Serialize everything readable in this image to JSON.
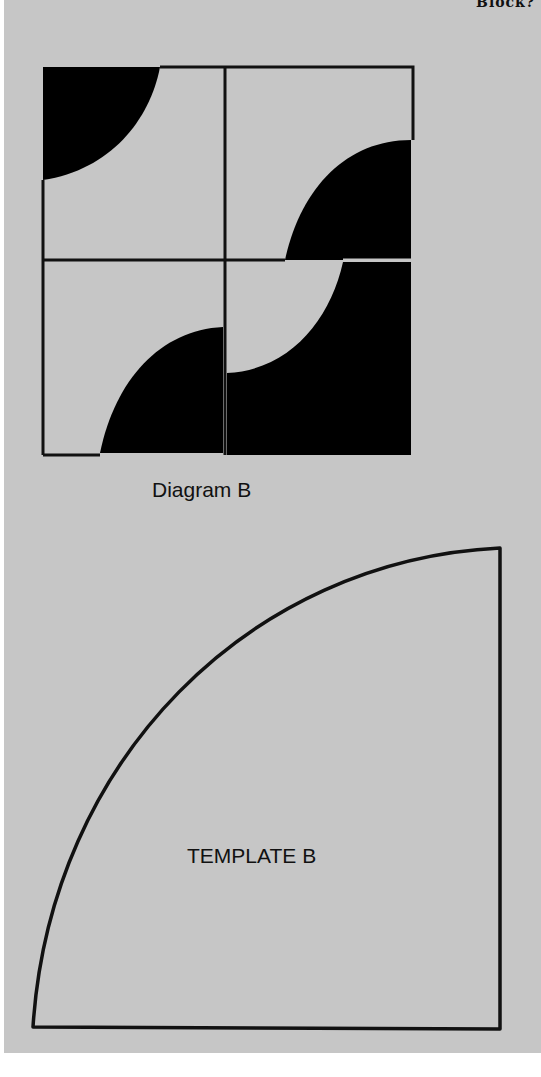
{
  "page": {
    "header_fragment": "Block?",
    "background_color": "#c6c6c6"
  },
  "diagram": {
    "label": "Diagram B",
    "fill_color": "#000000",
    "line_color": "#111111",
    "grid": "2x2",
    "quadrants": [
      {
        "position": "top-left",
        "shape": "quarter-circle filled, corner top-left"
      },
      {
        "position": "top-right",
        "shape": "quarter-circle filled, corner bottom-right"
      },
      {
        "position": "bottom-left",
        "shape": "quarter-circle filled, corner bottom-right"
      },
      {
        "position": "bottom-right",
        "shape": "filled square with light quarter-circle cutout at top-left"
      }
    ]
  },
  "template": {
    "label": "TEMPLATE B",
    "shape": "quarter-circle (fan) outline"
  }
}
